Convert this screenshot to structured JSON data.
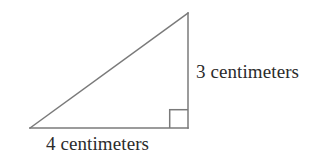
{
  "figure": {
    "kind": "right-triangle-diagram",
    "background_color": "#ffffff",
    "stroke_color": "#7a7a7a",
    "stroke_width": 1.5,
    "text_color": "#2b2b2b",
    "vertices": {
      "apex": [
        188,
        13
      ],
      "bottom_left": [
        30,
        128
      ],
      "bottom_right": [
        188,
        128
      ]
    },
    "right_angle_marker": {
      "at_vertex": "bottom_right",
      "size": 19,
      "x": 169,
      "y": 109
    },
    "labels": {
      "vertical_leg": "3 centimeters",
      "horizontal_leg": "4 centimeters"
    }
  }
}
